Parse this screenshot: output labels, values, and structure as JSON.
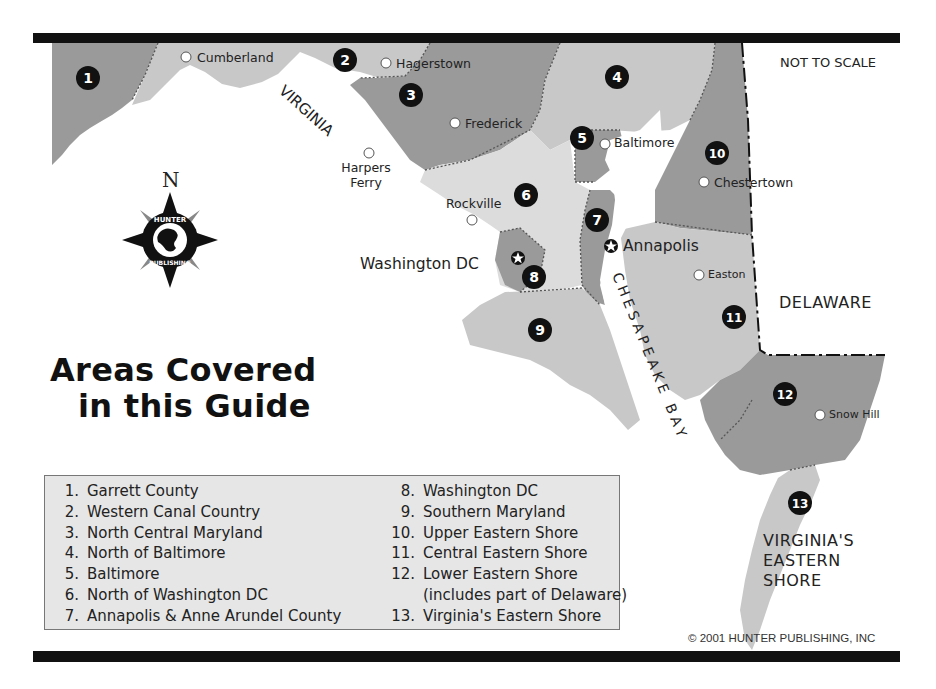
{
  "title": {
    "line1": "Areas Covered",
    "line2": "in this Guide"
  },
  "scale_note": "NOT TO SCALE",
  "copyright": "© 2001 HUNTER PUBLISHING, INC",
  "compass": {
    "north_label": "N",
    "logo_top_text": "HUNTER",
    "logo_bottom_text": "PUBLISHING",
    "icon": "compass-rose-icon"
  },
  "states": {
    "virginia": "VIRGINIA",
    "delaware": "DELAWARE",
    "virginia_eastern_shore": [
      "VIRGINIA'S",
      "EASTERN",
      "SHORE"
    ],
    "bay": "CHESAPEAKE BAY"
  },
  "cities": [
    {
      "name": "Cumberland",
      "marker": "circle"
    },
    {
      "name": "Hagerstown",
      "marker": "circle"
    },
    {
      "name": "Frederick",
      "marker": "circle"
    },
    {
      "name": "Harpers",
      "name2": "Ferry",
      "marker": "circle"
    },
    {
      "name": "Baltimore",
      "marker": "circle"
    },
    {
      "name": "Chestertown",
      "marker": "circle"
    },
    {
      "name": "Rockville",
      "marker": "circle"
    },
    {
      "name": "Washington DC",
      "marker": "star"
    },
    {
      "name": "Annapolis",
      "marker": "star"
    },
    {
      "name": "Easton",
      "marker": "circle"
    },
    {
      "name": "Snow Hill",
      "marker": "circle"
    }
  ],
  "region_badges": [
    "1",
    "2",
    "3",
    "4",
    "5",
    "6",
    "7",
    "8",
    "9",
    "10",
    "11",
    "12",
    "13"
  ],
  "legend": {
    "left": [
      {
        "num": "1.",
        "label": "Garrett County"
      },
      {
        "num": "2.",
        "label": "Western Canal Country"
      },
      {
        "num": "3.",
        "label": "North Central Maryland"
      },
      {
        "num": "4.",
        "label": "North of Baltimore"
      },
      {
        "num": "5.",
        "label": "Baltimore"
      },
      {
        "num": "6.",
        "label": "North of Washington DC"
      },
      {
        "num": "7.",
        "label": "Annapolis & Anne Arundel County"
      }
    ],
    "right": [
      {
        "num": "8.",
        "label": "Washington DC"
      },
      {
        "num": "9.",
        "label": "Southern Maryland"
      },
      {
        "num": "10.",
        "label": "Upper Eastern Shore"
      },
      {
        "num": "11.",
        "label": "Central Eastern Shore"
      },
      {
        "num": "12.",
        "label": "Lower Eastern Shore"
      },
      {
        "num": "",
        "label": "(includes part of Delaware)"
      },
      {
        "num": "13.",
        "label": "Virginia's Eastern Shore"
      }
    ]
  },
  "colors": {
    "dark_region": "#9a9a9a",
    "light_region": "#c8c8c8",
    "lighter_region": "#dcdcdc",
    "water": "#ffffff",
    "badge": "#111111",
    "legend_bg": "#e6e6e6",
    "border_bar": "#111111"
  }
}
